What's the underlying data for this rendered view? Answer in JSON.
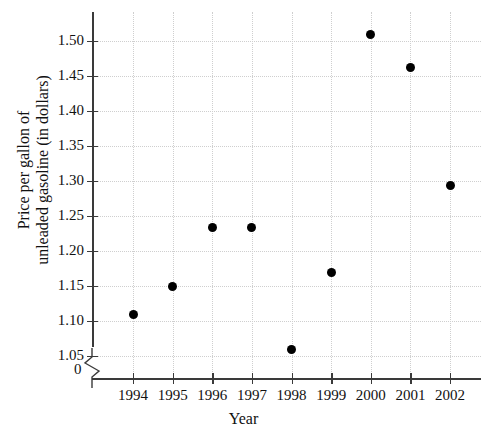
{
  "chart_data": {
    "type": "scatter",
    "title": "",
    "xlabel": "Year",
    "ylabel": "Price per gallon of unleaded gasoline (in dollars)",
    "ylabel_line1": "Price per gallon of",
    "ylabel_line2": "unleaded gasoline (in dollars)",
    "categories": [
      1994,
      1995,
      1996,
      1997,
      1998,
      1999,
      2000,
      2001,
      2002
    ],
    "x": [
      1994,
      1995,
      1996,
      1997,
      1998,
      1999,
      2000,
      2001,
      2002
    ],
    "values": [
      1.11,
      1.15,
      1.233,
      1.233,
      1.06,
      1.17,
      1.51,
      1.462,
      1.293
    ],
    "xtick_labels": [
      "1994",
      "1995",
      "1996",
      "1997",
      "1998",
      "1999",
      "2000",
      "2001",
      "2002"
    ],
    "ytick_labels": [
      "1.05",
      "1.10",
      "1.15",
      "1.20",
      "1.25",
      "1.30",
      "1.35",
      "1.40",
      "1.45",
      "1.50"
    ],
    "ytick_values": [
      1.05,
      1.1,
      1.15,
      1.2,
      1.25,
      1.3,
      1.35,
      1.4,
      1.45,
      1.5
    ],
    "zero_label": "0",
    "axis_break": true,
    "xlim": [
      1993.4,
      2002.6
    ],
    "ylim": [
      1.05,
      1.525
    ],
    "grid": true,
    "legend": null,
    "marker_color": "#000000",
    "grid_color": "#cfcfcf",
    "axis_color": "#3a3a3a"
  }
}
